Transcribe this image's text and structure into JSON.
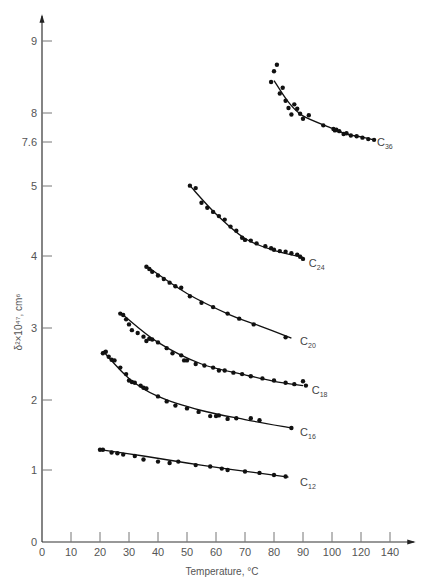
{
  "chart_data": {
    "type": "scatter",
    "title": "",
    "xlabel": "Temperature, °C",
    "ylabel": "δ²×10⁴⁷, cm⁶",
    "x_ticks": [
      0,
      10,
      20,
      30,
      40,
      50,
      60,
      70,
      80,
      90,
      100,
      120,
      140
    ],
    "y_ticks": [
      0,
      1,
      2,
      3,
      4,
      5,
      7.6,
      8,
      9
    ],
    "x_axis_note": "broken scale above 100 (100, 120, 140 evenly spaced at 10-unit width)",
    "y_axis_note": "broken scale between 5 and 7.6",
    "grid": false,
    "legend": "inline labels at curve ends",
    "series": [
      {
        "name": "C36",
        "label_main": "C",
        "label_sub": "36",
        "points": [
          [
            79,
            8.43
          ],
          [
            80,
            8.58
          ],
          [
            81,
            8.67
          ],
          [
            82,
            8.27
          ],
          [
            83,
            8.35
          ],
          [
            84,
            8.17
          ],
          [
            85,
            8.07
          ],
          [
            86,
            7.98
          ],
          [
            87,
            8.12
          ],
          [
            88,
            8.06
          ],
          [
            89,
            7.99
          ],
          [
            90,
            7.92
          ],
          [
            92,
            7.97
          ],
          [
            97,
            7.83
          ],
          [
            101,
            7.78
          ],
          [
            102,
            7.76
          ],
          [
            103,
            7.77
          ],
          [
            105,
            7.75
          ],
          [
            108,
            7.71
          ],
          [
            110,
            7.72
          ],
          [
            113,
            7.69
          ],
          [
            117,
            7.68
          ],
          [
            121,
            7.66
          ],
          [
            125,
            7.64
          ],
          [
            129,
            7.63
          ]
        ],
        "fit": [
          [
            80,
            8.45
          ],
          [
            85,
            8.15
          ],
          [
            90,
            7.96
          ],
          [
            100,
            7.79
          ],
          [
            110,
            7.71
          ],
          [
            120,
            7.67
          ],
          [
            129,
            7.63
          ]
        ],
        "label_at": [
          131,
          7.59
        ]
      },
      {
        "name": "C24",
        "label_main": "C",
        "label_sub": "24",
        "points": [
          [
            51,
            5.02
          ],
          [
            53,
            4.97
          ],
          [
            55,
            4.76
          ],
          [
            57,
            4.69
          ],
          [
            59,
            4.63
          ],
          [
            61,
            4.57
          ],
          [
            63,
            4.52
          ],
          [
            65,
            4.42
          ],
          [
            67,
            4.36
          ],
          [
            69,
            4.26
          ],
          [
            70,
            4.23
          ],
          [
            72,
            4.22
          ],
          [
            74,
            4.18
          ],
          [
            77,
            4.14
          ],
          [
            79,
            4.11
          ],
          [
            80,
            4.09
          ],
          [
            82,
            4.07
          ],
          [
            84,
            4.06
          ],
          [
            86,
            4.04
          ],
          [
            88,
            4.02
          ],
          [
            89,
            3.99
          ],
          [
            90,
            3.96
          ]
        ],
        "fit": [
          [
            51,
            5.02
          ],
          [
            60,
            4.6
          ],
          [
            70,
            4.25
          ],
          [
            80,
            4.08
          ],
          [
            90,
            3.98
          ]
        ],
        "label_at": [
          92,
          3.9
        ]
      },
      {
        "name": "C20",
        "label_main": "C",
        "label_sub": "20",
        "points": [
          [
            36,
            3.85
          ],
          [
            37,
            3.82
          ],
          [
            38,
            3.78
          ],
          [
            40,
            3.73
          ],
          [
            42,
            3.68
          ],
          [
            44,
            3.63
          ],
          [
            46,
            3.58
          ],
          [
            48,
            3.56
          ],
          [
            51,
            3.44
          ],
          [
            55,
            3.35
          ],
          [
            59,
            3.29
          ],
          [
            64,
            3.2
          ],
          [
            68,
            3.13
          ],
          [
            73,
            3.05
          ],
          [
            84,
            2.87
          ]
        ],
        "fit": [
          [
            36,
            3.86
          ],
          [
            50,
            3.48
          ],
          [
            65,
            3.18
          ],
          [
            75,
            3.03
          ],
          [
            86,
            2.86
          ]
        ],
        "label_at": [
          89,
          2.82
        ]
      },
      {
        "name": "C18",
        "label_main": "C",
        "label_sub": "18",
        "points": [
          [
            27,
            3.2
          ],
          [
            28,
            3.18
          ],
          [
            29,
            3.12
          ],
          [
            30,
            3.05
          ],
          [
            31,
            2.97
          ],
          [
            33,
            2.93
          ],
          [
            35,
            2.88
          ],
          [
            36,
            2.82
          ],
          [
            37,
            2.85
          ],
          [
            38,
            2.84
          ],
          [
            40,
            2.8
          ],
          [
            43,
            2.72
          ],
          [
            45,
            2.65
          ],
          [
            48,
            2.62
          ],
          [
            49,
            2.55
          ],
          [
            50,
            2.55
          ],
          [
            53,
            2.5
          ],
          [
            56,
            2.48
          ],
          [
            59,
            2.45
          ],
          [
            61,
            2.41
          ],
          [
            63,
            2.41
          ],
          [
            66,
            2.38
          ],
          [
            69,
            2.36
          ],
          [
            72,
            2.33
          ],
          [
            76,
            2.3
          ],
          [
            80,
            2.27
          ],
          [
            84,
            2.24
          ],
          [
            87,
            2.22
          ],
          [
            90,
            2.26
          ],
          [
            91,
            2.2
          ]
        ],
        "fit": [
          [
            28,
            3.18
          ],
          [
            40,
            2.8
          ],
          [
            55,
            2.5
          ],
          [
            70,
            2.35
          ],
          [
            80,
            2.26
          ],
          [
            90,
            2.2
          ]
        ],
        "label_at": [
          93,
          2.14
        ]
      },
      {
        "name": "C16",
        "label_main": "C",
        "label_sub": "16",
        "points": [
          [
            21,
            2.65
          ],
          [
            22,
            2.67
          ],
          [
            23,
            2.6
          ],
          [
            24,
            2.56
          ],
          [
            25,
            2.55
          ],
          [
            27,
            2.45
          ],
          [
            29,
            2.36
          ],
          [
            30,
            2.27
          ],
          [
            31,
            2.25
          ],
          [
            32,
            2.24
          ],
          [
            34,
            2.2
          ],
          [
            35,
            2.17
          ],
          [
            36,
            2.16
          ],
          [
            40,
            2.05
          ],
          [
            43,
            1.98
          ],
          [
            46,
            1.92
          ],
          [
            50,
            1.88
          ],
          [
            54,
            1.83
          ],
          [
            58,
            1.77
          ],
          [
            60,
            1.77
          ],
          [
            61,
            1.78
          ],
          [
            64,
            1.73
          ],
          [
            67,
            1.74
          ],
          [
            72,
            1.74
          ],
          [
            75,
            1.71
          ],
          [
            86,
            1.6
          ]
        ],
        "fit": [
          [
            21,
            2.68
          ],
          [
            30,
            2.3
          ],
          [
            40,
            2.05
          ],
          [
            55,
            1.85
          ],
          [
            70,
            1.72
          ],
          [
            86,
            1.6
          ]
        ],
        "label_at": [
          89,
          1.55
        ]
      },
      {
        "name": "C12",
        "label_main": "C",
        "label_sub": "12",
        "points": [
          [
            20,
            1.29
          ],
          [
            21,
            1.29
          ],
          [
            24,
            1.25
          ],
          [
            26,
            1.24
          ],
          [
            28,
            1.22
          ],
          [
            32,
            1.2
          ],
          [
            35,
            1.15
          ],
          [
            40,
            1.12
          ],
          [
            44,
            1.1
          ],
          [
            47,
            1.12
          ],
          [
            53,
            1.07
          ],
          [
            58,
            1.05
          ],
          [
            62,
            1.02
          ],
          [
            64,
            1.0
          ],
          [
            70,
            0.98
          ],
          [
            75,
            0.96
          ],
          [
            80,
            0.93
          ],
          [
            84,
            0.91
          ]
        ],
        "fit": [
          [
            20,
            1.29
          ],
          [
            35,
            1.2
          ],
          [
            50,
            1.1
          ],
          [
            65,
            1.01
          ],
          [
            85,
            0.9
          ]
        ],
        "label_at": [
          89,
          0.84
        ]
      }
    ]
  }
}
